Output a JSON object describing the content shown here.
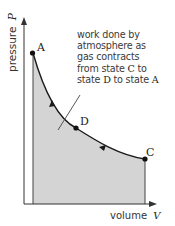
{
  "diagram": {
    "y_axis_label": "pressure",
    "y_axis_symbol": "P",
    "x_axis_label": "volume",
    "x_axis_symbol": "V",
    "states": [
      {
        "id": "A",
        "label": "A"
      },
      {
        "id": "D",
        "label": "D"
      },
      {
        "id": "C",
        "label": "C"
      }
    ],
    "annotation": {
      "lines": [
        "work done by",
        "atmosphere as",
        "gas contracts"
      ],
      "line4_prefix": "from state ",
      "line4_state": "C",
      "line4_suffix": " to",
      "line5_prefix": "state ",
      "line5_state1": "D",
      "line5_mid": " to state ",
      "line5_state2": "A"
    },
    "colors": {
      "shaded_area": "#d4d4d4",
      "curve": "#1a1a1a",
      "axes": "#333333",
      "text": "#333333"
    }
  }
}
